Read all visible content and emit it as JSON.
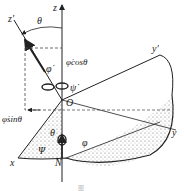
{
  "diagram": {
    "labels": {
      "z_prime": "z'",
      "z": "z",
      "theta_top": "θ",
      "phi_dot": "φ̇",
      "phi_dot_cos_theta": "φ̇cosθ",
      "psi_dot": "ψ̇",
      "origin": "O",
      "y_prime": "y'",
      "phi_dot_sin_theta": "φ̇sinθ",
      "theta_mid": "θ",
      "psi": "Ψ",
      "phi": "φ",
      "x": "x",
      "y": "y",
      "node": "N"
    },
    "caption": "图"
  }
}
